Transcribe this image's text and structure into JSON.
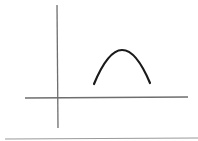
{
  "diagram": {
    "colors": {
      "background": "#ffffff",
      "axis": "#6e6e6e",
      "curve": "#1a1a1a",
      "baseline": "#9a9a9a"
    },
    "y_axis": {
      "x1": 57,
      "y1": 5,
      "x2": 58,
      "y2": 128
    },
    "x_axis": {
      "x1": 25,
      "y1": 98,
      "x2": 188,
      "y2": 97
    },
    "curve": {
      "start": [
        94,
        84
      ],
      "peak": [
        122,
        50
      ],
      "end": [
        150,
        83
      ]
    },
    "baseline": {
      "x1": 5,
      "y1": 139,
      "x2": 198,
      "y2": 138
    }
  }
}
